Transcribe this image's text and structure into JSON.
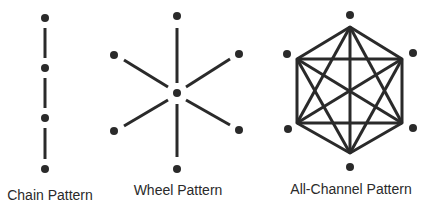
{
  "diagram": {
    "colors": {
      "ink": "#2a2a2a",
      "background": "#ffffff"
    },
    "panels": [
      {
        "id": "chain",
        "label": "Chain Pattern",
        "nodes": 4,
        "topology": "line"
      },
      {
        "id": "wheel",
        "label": "Wheel Pattern",
        "nodes": 7,
        "topology": "star (1 hub, 6 spokes)"
      },
      {
        "id": "all-channel",
        "label": "All-Channel Pattern",
        "nodes": 6,
        "topology": "complete graph K6 (hexagon with all diagonals)"
      }
    ]
  }
}
